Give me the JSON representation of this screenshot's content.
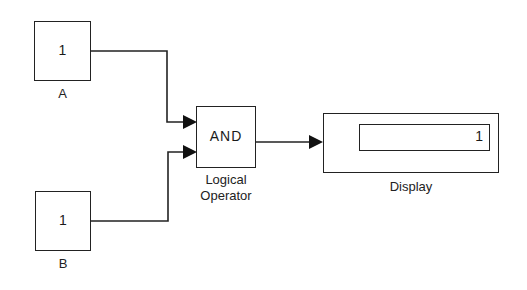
{
  "diagram": {
    "blocks": {
      "a": {
        "value": "1",
        "label": "A"
      },
      "b": {
        "value": "1",
        "label": "B"
      },
      "logical_operator": {
        "operator": "AND",
        "label_line1": "Logical",
        "label_line2": "Operator"
      },
      "display": {
        "value": "1",
        "label": "Display"
      }
    },
    "colors": {
      "line": "#222222",
      "background": "#ffffff"
    }
  }
}
